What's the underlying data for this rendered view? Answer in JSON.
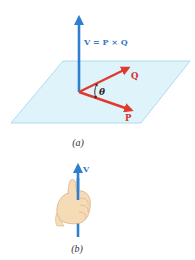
{
  "figure_a": {
    "caption": "(a)",
    "v_label": "V = P × Q",
    "q_label": "Q",
    "p_label": "P",
    "theta_label": "θ",
    "colors": {
      "v_vector": "#2f7fd0",
      "p_q_vectors": "#e0392d",
      "label_red": "#d8322a",
      "plane_fill": "#dff3fb",
      "plane_edge": "#9fd3ea",
      "v_label": "#3a78c4"
    }
  },
  "figure_b": {
    "caption": "(b)",
    "v_label": "V",
    "colors": {
      "v_vector": "#2f7fd0",
      "hand_fill": "#f6dcb6",
      "hand_edge": "#d9b088"
    }
  }
}
